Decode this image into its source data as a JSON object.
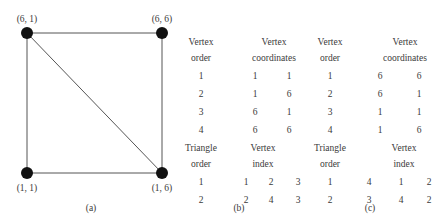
{
  "panel_a": {
    "caption": "(a)",
    "vertices": [
      {
        "label": "(6, 1)",
        "pos": "top-left"
      },
      {
        "label": "(6, 6)",
        "pos": "top-right"
      },
      {
        "label": "(1, 1)",
        "pos": "bottom-left"
      },
      {
        "label": "(1, 6)",
        "pos": "bottom-right"
      }
    ],
    "edges": [
      "top",
      "bottom",
      "left",
      "right",
      "diagonal top-left to bottom-right"
    ]
  },
  "panel_b": {
    "caption": "(b)",
    "vertex_table": {
      "header_order": [
        "Vertex",
        "order"
      ],
      "header_coords": [
        "Vertex",
        "coordinates"
      ],
      "rows": [
        {
          "order": "1",
          "x": "1",
          "y": "1"
        },
        {
          "order": "2",
          "x": "1",
          "y": "6"
        },
        {
          "order": "3",
          "x": "6",
          "y": "1"
        },
        {
          "order": "4",
          "x": "6",
          "y": "6"
        }
      ]
    },
    "triangle_table": {
      "header_order": [
        "Triangle",
        "order"
      ],
      "header_index": [
        "Vertex",
        "index"
      ],
      "rows": [
        {
          "order": "1",
          "v1": "1",
          "v2": "2",
          "v3": "3"
        },
        {
          "order": "2",
          "v1": "2",
          "v2": "4",
          "v3": "3"
        }
      ]
    }
  },
  "panel_c": {
    "caption": "(c)",
    "vertex_table": {
      "header_order": [
        "Vertex",
        "order"
      ],
      "header_coords": [
        "Vertex",
        "coordinates"
      ],
      "rows": [
        {
          "order": "1",
          "x": "6",
          "y": "6"
        },
        {
          "order": "2",
          "x": "6",
          "y": "1"
        },
        {
          "order": "3",
          "x": "1",
          "y": "1"
        },
        {
          "order": "4",
          "x": "1",
          "y": "6"
        }
      ]
    },
    "triangle_table": {
      "header_order": [
        "Triangle",
        "order"
      ],
      "header_index": [
        "Vertex",
        "index"
      ],
      "rows": [
        {
          "order": "1",
          "v1": "4",
          "v2": "1",
          "v3": "2"
        },
        {
          "order": "2",
          "v1": "3",
          "v2": "4",
          "v3": "2"
        }
      ]
    }
  }
}
